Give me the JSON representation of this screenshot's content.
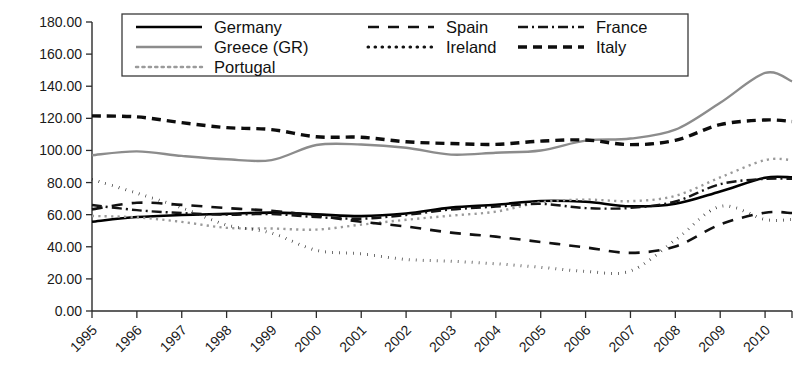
{
  "chart_data": {
    "type": "line",
    "title": "",
    "subtitle": "",
    "xlabel": "",
    "ylabel": "",
    "xlim": [
      1995,
      2010.6
    ],
    "ylim": [
      0,
      180
    ],
    "grid": false,
    "legend_position": "top-center",
    "x": [
      1995,
      1996,
      1997,
      1998,
      1999,
      2000,
      2001,
      2002,
      2003,
      2004,
      2005,
      2006,
      2007,
      2008,
      2009,
      2010,
      2010.6
    ],
    "y_ticks": [
      0,
      20,
      40,
      60,
      80,
      100,
      120,
      140,
      160,
      180
    ],
    "y_tick_labels": [
      "0.00",
      "20.00",
      "40.00",
      "60.00",
      "80.00",
      "100.00",
      "120.00",
      "140.00",
      "160.00",
      "180.00"
    ],
    "x_tick_labels": [
      "1995",
      "1996",
      "1997",
      "1998",
      "1999",
      "2000",
      "2001",
      "2002",
      "2003",
      "2004",
      "2005",
      "2006",
      "2007",
      "2008",
      "2009",
      "2010"
    ],
    "series": [
      {
        "name": "Germany",
        "style": "solid",
        "color": "#000000",
        "width": 2.6,
        "dash": "",
        "values": [
          55.6,
          58.5,
          59.8,
          60.5,
          61.3,
          60.2,
          59.1,
          60.7,
          64.4,
          66.2,
          68.5,
          68.0,
          65.2,
          66.8,
          74.5,
          83.0,
          83.2
        ]
      },
      {
        "name": "Greece (GR)",
        "style": "solid-gray",
        "color": "#8c8c8c",
        "width": 2.4,
        "dash": "",
        "values": [
          97.0,
          99.4,
          96.6,
          94.5,
          94.0,
          103.4,
          103.7,
          101.7,
          97.4,
          98.6,
          100.0,
          106.1,
          107.4,
          112.9,
          129.7,
          148.3,
          143.0
        ]
      },
      {
        "name": "Portugal",
        "style": "dotted-light",
        "color": "#9a9a9a",
        "width": 2.4,
        "dash": "2.2 4.2",
        "values": [
          59.2,
          58.3,
          55.5,
          51.8,
          51.4,
          50.7,
          53.8,
          56.8,
          59.4,
          61.9,
          67.7,
          69.4,
          68.4,
          71.7,
          83.2,
          94.0,
          94.0
        ]
      },
      {
        "name": "Spain",
        "style": "long-dash",
        "color": "#111111",
        "width": 2.6,
        "dash": "11 9",
        "values": [
          63.3,
          67.4,
          66.1,
          64.1,
          62.4,
          59.4,
          55.6,
          52.6,
          48.8,
          46.3,
          43.0,
          39.6,
          36.2,
          40.2,
          53.9,
          61.2,
          61.0
        ]
      },
      {
        "name": "Ireland",
        "style": "dotted",
        "color": "#121212",
        "width": 3.0,
        "dash": "0.6 6.4",
        "values": [
          82.0,
          73.4,
          64.3,
          53.6,
          48.5,
          37.8,
          35.6,
          32.1,
          31.0,
          29.4,
          27.2,
          24.7,
          24.9,
          44.2,
          65.1,
          57.0,
          57.0
        ]
      },
      {
        "name": "France",
        "style": "dash-dot",
        "color": "#151515",
        "width": 2.4,
        "dash": "10 4 2 4",
        "values": [
          66.0,
          62.8,
          61.0,
          60.0,
          60.4,
          58.5,
          57.5,
          59.8,
          63.2,
          65.0,
          66.7,
          64.1,
          64.2,
          68.2,
          79.0,
          82.3,
          82.3
        ]
      },
      {
        "name": "Italy",
        "style": "dashed",
        "color": "#0d0d0d",
        "width": 3.4,
        "dash": "9 6",
        "values": [
          121.5,
          120.9,
          117.3,
          114.2,
          113.0,
          108.5,
          108.2,
          105.4,
          104.3,
          103.8,
          105.8,
          106.5,
          103.6,
          106.3,
          116.1,
          119.0,
          118.0
        ]
      }
    ],
    "legend": {
      "columns": [
        [
          {
            "label": "Germany",
            "key": "Germany"
          },
          {
            "label": "Greece (GR)",
            "key": "Greece (GR)"
          },
          {
            "label": "Portugal",
            "key": "Portugal"
          }
        ],
        [
          {
            "label": "Spain",
            "key": "Spain"
          },
          {
            "label": "Ireland",
            "key": "Ireland"
          }
        ],
        [
          {
            "label": "France",
            "key": "France"
          },
          {
            "label": "Italy",
            "key": "Italy"
          }
        ]
      ]
    }
  },
  "geometry": {
    "plot_left": 92,
    "plot_right": 792,
    "plot_top": 22,
    "plot_bottom": 311,
    "x_tick_step": 43.2,
    "legend_box": {
      "x": 122,
      "y": 14,
      "w": 566,
      "h": 62
    }
  }
}
